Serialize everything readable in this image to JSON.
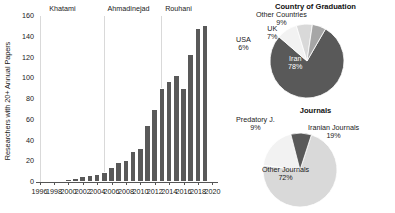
{
  "chart_data": [
    {
      "type": "bar",
      "title": "",
      "xlabel": "",
      "ylabel": "Researchers with 20+ Annual Papers",
      "ylim": [
        0,
        160
      ],
      "xlim": [
        1995.5,
        2020.5
      ],
      "yticks": [
        0,
        20,
        40,
        60,
        80,
        100,
        120,
        140,
        160
      ],
      "xticks": [
        1996,
        1998,
        2000,
        2002,
        2004,
        2006,
        2008,
        2010,
        2012,
        2014,
        2016,
        2018,
        2020
      ],
      "grid": false,
      "bar_color": "#595959",
      "categories": [
        1996,
        1997,
        1998,
        1999,
        2000,
        2001,
        2002,
        2003,
        2004,
        2005,
        2006,
        2007,
        2008,
        2009,
        2010,
        2011,
        2012,
        2013,
        2014,
        2015,
        2016,
        2017,
        2018,
        2019
      ],
      "values": [
        0,
        0,
        1,
        1,
        3,
        4,
        6,
        7,
        8,
        10,
        14,
        19,
        21,
        30,
        33,
        55,
        70,
        91,
        97,
        103,
        91,
        123,
        148,
        151
      ],
      "annotations": [
        {
          "label": "Khatami",
          "x": 1997.2,
          "divider_x": 1996.0
        },
        {
          "label": "Ahmadinejad",
          "x": 2005.3,
          "divider_x": 2004.9
        },
        {
          "label": "Rouhani",
          "x": 2013.3,
          "divider_x": 2012.9
        }
      ]
    },
    {
      "type": "pie",
      "title": "Country of Graduation",
      "labels": [
        "Iran",
        "Other Countries",
        "UK",
        "USA"
      ],
      "values": [
        78,
        9,
        7,
        6
      ],
      "display_values": [
        "78%",
        "9%",
        "7%",
        "6%"
      ],
      "colors": [
        "#595959",
        "#f2f2f2",
        "#d9d9d9",
        "#a6a6a6"
      ],
      "legend": "none"
    },
    {
      "type": "pie",
      "title": "Journals",
      "labels": [
        "Other Journals",
        "Iranian Journals",
        "Predatory J."
      ],
      "values": [
        72,
        19,
        9
      ],
      "display_values": [
        "72%",
        "19%",
        "9%"
      ],
      "colors": [
        "#d9d9d9",
        "#f2f2f2",
        "#595959"
      ],
      "legend": "none"
    }
  ],
  "bar_chart": {
    "ylabel": "Researchers with 20+ Annual Papers",
    "yticks": [
      "0",
      "20",
      "40",
      "60",
      "80",
      "100",
      "120",
      "140",
      "160"
    ],
    "xticks": [
      "1996",
      "1998",
      "2000",
      "2002",
      "2004",
      "2006",
      "2008",
      "2010",
      "2012",
      "2014",
      "2016",
      "2018",
      "2020"
    ],
    "eras": [
      "Khatami",
      "Ahmadinejad",
      "Rouhani"
    ]
  },
  "pie_country": {
    "title": "Country of Graduation",
    "slices": [
      {
        "name": "Iran",
        "pct": "78%"
      },
      {
        "name": "Other Countries",
        "pct": "9%"
      },
      {
        "name": "UK",
        "pct": "7%"
      },
      {
        "name": "USA",
        "pct": "6%"
      }
    ]
  },
  "pie_journals": {
    "title": "Journals",
    "slices": [
      {
        "name": "Other Journals",
        "pct": "72%"
      },
      {
        "name": "Iranian Journals",
        "pct": "19%"
      },
      {
        "name": "Predatory J.",
        "pct": "9%"
      }
    ]
  }
}
